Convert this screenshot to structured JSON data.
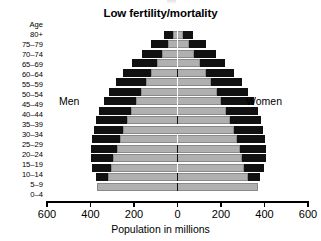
{
  "chart": {
    "title": "Low fertility/mortality",
    "age_axis_title": "Age",
    "xlabel": "Population in millions",
    "left_side_label": "Men",
    "right_side_label": "Women"
  },
  "chart_data": {
    "type": "bar",
    "subtype": "population-pyramid",
    "title": "Low fertility/mortality",
    "xlabel": "Population in millions",
    "ylabel": "Age",
    "orientation": "horizontal",
    "xlim": [
      -600,
      600
    ],
    "xticks": [
      600,
      400,
      200,
      0,
      200,
      400,
      600
    ],
    "xtick_labels": [
      "600",
      "400",
      "200",
      "0",
      "200",
      "400",
      "600"
    ],
    "grid": false,
    "legend": false,
    "center_value": 0,
    "left_direction_label": "Men",
    "right_direction_label": "Women",
    "units": "millions",
    "categories": [
      "80+",
      "75-79",
      "70-74",
      "65-69",
      "60-64",
      "55-59",
      "50-54",
      "45-49",
      "40-44",
      "35-39",
      "30-34",
      "25-29",
      "20-24",
      "15-19",
      "10-14",
      "5-9",
      "0-4"
    ],
    "series": [
      {
        "name": "Outer (black)",
        "color": "#111111",
        "men": [
          60,
          120,
          165,
          210,
          250,
          285,
          315,
          340,
          360,
          375,
          385,
          395,
          400,
          400,
          395,
          375,
          350
        ],
        "women": [
          70,
          130,
          175,
          220,
          260,
          295,
          325,
          350,
          368,
          382,
          392,
          400,
          405,
          405,
          398,
          378,
          352
        ]
      },
      {
        "name": "Inner (gray)",
        "color": "#b0b0b0",
        "men": [
          22,
          45,
          70,
          95,
          120,
          145,
          170,
          192,
          212,
          232,
          250,
          265,
          280,
          295,
          305,
          320,
          370
        ],
        "women": [
          26,
          52,
          78,
          104,
          130,
          155,
          180,
          202,
          222,
          240,
          258,
          272,
          286,
          298,
          308,
          322,
          372
        ]
      }
    ]
  }
}
